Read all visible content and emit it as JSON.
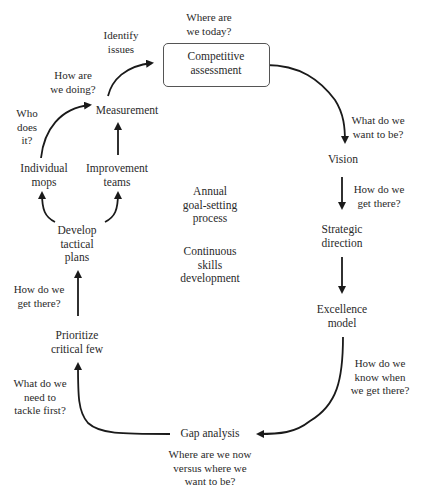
{
  "diagram": {
    "type": "cycle",
    "center": {
      "line1": [
        "Annual",
        "goal-setting",
        "process"
      ],
      "line2": [
        "Continuous",
        "skills",
        "development"
      ]
    },
    "nodes": {
      "competitive_assessment": [
        "Competitive",
        "assessment"
      ],
      "vision": [
        "Vision"
      ],
      "strategic_direction": [
        "Strategic",
        "direction"
      ],
      "excellence_model": [
        "Excellence",
        "model"
      ],
      "gap_analysis": [
        "Gap analysis"
      ],
      "prioritize": [
        "Prioritize",
        "critical few"
      ],
      "develop_plans": [
        "Develop",
        "tactical",
        "plans"
      ],
      "individual_mops": [
        "Individual",
        "mops"
      ],
      "improvement_teams": [
        "Improvement",
        "teams"
      ],
      "measurement": [
        "Measurement"
      ]
    },
    "questions": {
      "where_today": [
        "Where are",
        "we today?"
      ],
      "want_to_be": [
        "What do we",
        "want to be?"
      ],
      "how_get_there_right": [
        "How do we",
        "get there?"
      ],
      "know_when": [
        "How do we",
        "know when",
        "we get there?"
      ],
      "where_now_vs": [
        "Where are we now",
        "versus where we",
        "want to be?"
      ],
      "tackle_first": [
        "What do we",
        "need to",
        "tackle first?"
      ],
      "how_get_there_left": [
        "How do we",
        "get there?"
      ],
      "who_does_it": [
        "Who",
        "does",
        "it?"
      ],
      "how_are_we_doing": [
        "How are",
        "we doing?"
      ],
      "identify_issues": [
        "Identify",
        "issues"
      ]
    },
    "colors": {
      "line": "#1a1a1a",
      "text": "#2a2a2a",
      "box_border": "#555555"
    }
  }
}
